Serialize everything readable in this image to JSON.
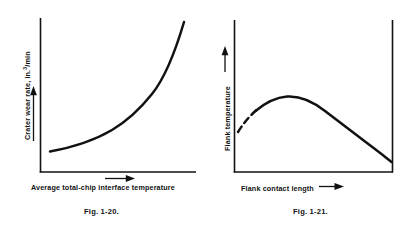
{
  "page": {
    "background_color": "#ffffff",
    "ink_color": "#111111",
    "figure_count": 2
  },
  "figures": [
    {
      "id": "fig-1-20",
      "caption": "Fig. 1-20.",
      "xlabel": "Average total-chip interface temperature",
      "ylabel_prefix": "Crater wear rate, in.",
      "ylabel_superscript": "3",
      "ylabel_suffix": "/min",
      "ylabel_full": "Crater wear rate, in.³/min",
      "x_axis_arrow": "right-arrow-under-x-axis",
      "y_axis_arrow": "up-arrow-left-of-y-axis",
      "frame": "left-and-bottom-axis-only"
    },
    {
      "id": "fig-1-21",
      "caption": "Fig. 1-21.",
      "xlabel": "Flank contact length",
      "ylabel_full": "Flank temperature",
      "x_axis_arrow": "right-arrow-after-x-label",
      "y_axis_arrow": "up-arrow-above-y-label",
      "frame": "left-bottom-and-right-axis"
    }
  ],
  "chart_data": [
    {
      "type": "line",
      "id": "fig-1-20",
      "title": "Fig. 1-20.",
      "xlabel": "Average total-chip interface temperature",
      "ylabel": "Crater wear rate, in.³/min",
      "grid": false,
      "legend": "none",
      "axis_ticks": "none",
      "xlim": [
        0,
        100
      ],
      "ylim": [
        0,
        100
      ],
      "description": "Monotonically increasing exponential curve: crater wear rate rises slowly then very steeply with temperature.",
      "series": [
        {
          "name": "crater wear rate",
          "style": "solid",
          "x": [
            6,
            14,
            22,
            30,
            38,
            46,
            54,
            62,
            70,
            78,
            84,
            89,
            93,
            96,
            98,
            100
          ],
          "y": [
            12,
            14,
            16.5,
            19.5,
            23,
            27,
            32,
            38.5,
            47,
            58,
            67,
            76,
            84,
            91,
            96,
            100
          ]
        }
      ]
    },
    {
      "type": "line",
      "id": "fig-1-21",
      "title": "Fig. 1-21.",
      "xlabel": "Flank contact length",
      "ylabel": "Flank temperature",
      "grid": false,
      "legend": "none",
      "axis_ticks": "none",
      "xlim": [
        0,
        100
      ],
      "ylim": [
        0,
        100
      ],
      "description": "Curve rises from a dashed (uncertain) start at the left axis, peaks at about one-quarter of the contact length, then falls steadily to the right axis.",
      "series": [
        {
          "name": "flank temperature",
          "style": "dashed-start-then-solid",
          "dashed_x_range": [
            2,
            14
          ],
          "x": [
            2,
            6,
            10,
            14,
            18,
            22,
            26,
            30,
            36,
            44,
            52,
            60,
            68,
            76,
            84,
            92,
            98
          ],
          "y": [
            47,
            56,
            63,
            68,
            72,
            74.5,
            75.5,
            75,
            73,
            69,
            64,
            58,
            52,
            45.5,
            39,
            32,
            27
          ]
        }
      ]
    }
  ]
}
